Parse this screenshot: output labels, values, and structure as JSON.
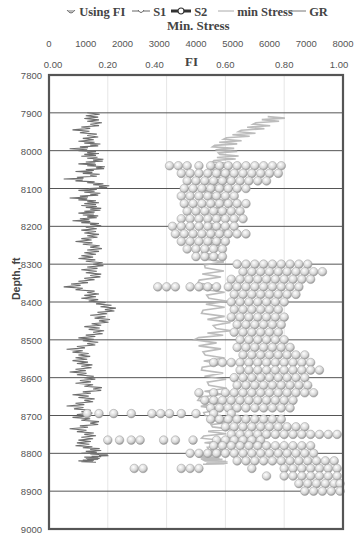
{
  "legend": [
    {
      "label": "Using FI",
      "marker": "bubble-sphere"
    },
    {
      "label": "S1",
      "marker": "thin-line-small-circle"
    },
    {
      "label": "S2",
      "marker": "thick-line-circle"
    },
    {
      "label": "min Stress",
      "marker": "light-line"
    },
    {
      "label": "GR",
      "marker": "dark-line"
    }
  ],
  "top_axis": {
    "title": "Min. Stress",
    "ticks": [
      "0",
      "1000",
      "2000",
      "3000",
      "4000",
      "5000",
      "6000",
      "7000",
      "8000"
    ]
  },
  "fi_axis": {
    "title": "FI",
    "ticks": [
      "0.00",
      "0.20",
      "0.40",
      "0.60",
      "0.80",
      "1.00"
    ]
  },
  "y_axis": {
    "title": "Depth, ft",
    "ticks": [
      "7800",
      "7900",
      "8000",
      "8100",
      "8200",
      "8300",
      "8400",
      "8500",
      "8600",
      "8700",
      "8800",
      "8900",
      "9000"
    ]
  },
  "colors": {
    "gr": "#6e6e6e",
    "min_stress": "#b5b5b5",
    "bubble": "#d9d9d9",
    "bubble_edge": "#8c8c8c",
    "grid": "#555555",
    "frame": "#555555"
  },
  "chart_data": {
    "type": "scatter",
    "title": "",
    "xlabel_top": "Min. Stress",
    "xlabel": "FI",
    "ylabel": "Depth, ft",
    "x_min_stress_range": [
      0,
      8000
    ],
    "x_fi_range": [
      0.0,
      1.0
    ],
    "ylim": [
      7800,
      9000
    ],
    "y_inverted": true,
    "grid": {
      "horizontal": true,
      "vertical": true
    },
    "legend_position": "top",
    "series": [
      {
        "name": "GR",
        "kind": "line",
        "x_fi_equiv": [
          0.15,
          0.14,
          0.16,
          0.1,
          0.15,
          0.12,
          0.16,
          0.09,
          0.15,
          0.13,
          0.17,
          0.12,
          0.18,
          0.11,
          0.16,
          0.07,
          0.15,
          0.19,
          0.12,
          0.16,
          0.09,
          0.15,
          0.13,
          0.16,
          0.12,
          0.15,
          0.1,
          0.16,
          0.13,
          0.15,
          0.11,
          0.16,
          0.14,
          0.12,
          0.17,
          0.13,
          0.16,
          0.12,
          0.07,
          0.15,
          0.13,
          0.18,
          0.21,
          0.16,
          0.19,
          0.14,
          0.17,
          0.12,
          0.15,
          0.08,
          0.12,
          0.1,
          0.13,
          0.09,
          0.14,
          0.11,
          0.17,
          0.1,
          0.14,
          0.08,
          0.13,
          0.1,
          0.16,
          0.09,
          0.14,
          0.12,
          0.11,
          0.16,
          0.13,
          0.19,
          0.14,
          0.15,
          0.12,
          0.14
        ],
        "depth": [
          7900,
          7915,
          7930,
          7945,
          7960,
          7975,
          7985,
          7995,
          8005,
          8015,
          8025,
          8035,
          8045,
          8055,
          8065,
          8075,
          8085,
          8095,
          8105,
          8115,
          8125,
          8135,
          8145,
          8155,
          8165,
          8175,
          8185,
          8195,
          8210,
          8225,
          8240,
          8255,
          8270,
          8285,
          8300,
          8315,
          8330,
          8345,
          8360,
          8375,
          8390,
          8405,
          8420,
          8435,
          8450,
          8465,
          8480,
          8495,
          8510,
          8525,
          8540,
          8555,
          8570,
          8585,
          8600,
          8615,
          8630,
          8645,
          8660,
          8675,
          8690,
          8705,
          8720,
          8735,
          8750,
          8765,
          8780,
          8790,
          8800,
          8805,
          8810,
          8815,
          8820,
          8825
        ]
      },
      {
        "name": "min Stress",
        "kind": "line",
        "x": [
          6200,
          5800,
          5400,
          5000,
          4700,
          4900,
          4700,
          4600,
          4800,
          4600,
          4500,
          4700,
          4500,
          4600,
          4400,
          4500,
          4300,
          4600,
          4400,
          4800,
          4200,
          4500,
          4400,
          4600,
          4300,
          4500,
          4700,
          4400,
          4600,
          4500,
          4300,
          4500,
          4600,
          4400
        ],
        "depth": [
          7910,
          7930,
          7950,
          7970,
          7990,
          8010,
          8030,
          8050,
          8070,
          8090,
          8110,
          8150,
          8190,
          8230,
          8270,
          8310,
          8350,
          8390,
          8430,
          8470,
          8500,
          8540,
          8580,
          8620,
          8660,
          8700,
          8730,
          8760,
          8790,
          8800,
          8810,
          8820,
          8825,
          8830
        ]
      },
      {
        "name": "Using FI",
        "kind": "scatter",
        "points": [
          {
            "depth": 8040,
            "fi": [
              0.41,
              0.44,
              0.47,
              0.51,
              0.55,
              0.58,
              0.61,
              0.64,
              0.67,
              0.7,
              0.73,
              0.76,
              0.79
            ]
          },
          {
            "depth": 8060,
            "fi": [
              0.45,
              0.48,
              0.51,
              0.54,
              0.57,
              0.6,
              0.63,
              0.66,
              0.69,
              0.72,
              0.75,
              0.78
            ]
          },
          {
            "depth": 8080,
            "fi": [
              0.47,
              0.5,
              0.53,
              0.56,
              0.59,
              0.62,
              0.65,
              0.68,
              0.71,
              0.74
            ]
          },
          {
            "depth": 8100,
            "fi": [
              0.46,
              0.49,
              0.52,
              0.55,
              0.58,
              0.61,
              0.64,
              0.67
            ]
          },
          {
            "depth": 8120,
            "fi": [
              0.45,
              0.48,
              0.51,
              0.54,
              0.57,
              0.6,
              0.63
            ]
          },
          {
            "depth": 8140,
            "fi": [
              0.46,
              0.49,
              0.52,
              0.55,
              0.58,
              0.61,
              0.64,
              0.67
            ]
          },
          {
            "depth": 8160,
            "fi": [
              0.47,
              0.5,
              0.53,
              0.56,
              0.59,
              0.62,
              0.65
            ]
          },
          {
            "depth": 8180,
            "fi": [
              0.45,
              0.48,
              0.51,
              0.54,
              0.57,
              0.6,
              0.63,
              0.66
            ]
          },
          {
            "depth": 8200,
            "fi": [
              0.42,
              0.45,
              0.48,
              0.51,
              0.54,
              0.57,
              0.6,
              0.63
            ]
          },
          {
            "depth": 8220,
            "fi": [
              0.43,
              0.46,
              0.49,
              0.52,
              0.55,
              0.58,
              0.61,
              0.64,
              0.67
            ]
          },
          {
            "depth": 8240,
            "fi": [
              0.45,
              0.48,
              0.51,
              0.54,
              0.57,
              0.6
            ]
          },
          {
            "depth": 8260,
            "fi": [
              0.47,
              0.5,
              0.53,
              0.56,
              0.59
            ]
          },
          {
            "depth": 8280,
            "fi": [
              0.5,
              0.53,
              0.56,
              0.59
            ]
          },
          {
            "depth": 8300,
            "fi": [
              0.64,
              0.67,
              0.7,
              0.73,
              0.76,
              0.79,
              0.82,
              0.85,
              0.88
            ]
          },
          {
            "depth": 8320,
            "fi": [
              0.66,
              0.69,
              0.72,
              0.75,
              0.78,
              0.81,
              0.84,
              0.87,
              0.9,
              0.93
            ]
          },
          {
            "depth": 8340,
            "fi": [
              0.62,
              0.65,
              0.68,
              0.71,
              0.74,
              0.77,
              0.8,
              0.83,
              0.86,
              0.89
            ]
          },
          {
            "depth": 8360,
            "fi": [
              0.37,
              0.4,
              0.43,
              0.48,
              0.51,
              0.54,
              0.57,
              0.61,
              0.64,
              0.67,
              0.7,
              0.73,
              0.76,
              0.79,
              0.82,
              0.85
            ]
          },
          {
            "depth": 8380,
            "fi": [
              0.63,
              0.66,
              0.69,
              0.72,
              0.75,
              0.78,
              0.81,
              0.84
            ]
          },
          {
            "depth": 8400,
            "fi": [
              0.62,
              0.65,
              0.68,
              0.71,
              0.74,
              0.77,
              0.8
            ]
          },
          {
            "depth": 8420,
            "fi": [
              0.63,
              0.66,
              0.69,
              0.72,
              0.75,
              0.78
            ]
          },
          {
            "depth": 8440,
            "fi": [
              0.62,
              0.65,
              0.68,
              0.71,
              0.74,
              0.77,
              0.8
            ]
          },
          {
            "depth": 8460,
            "fi": [
              0.64,
              0.67,
              0.7,
              0.73,
              0.76,
              0.79
            ]
          },
          {
            "depth": 8480,
            "fi": [
              0.63,
              0.66,
              0.69,
              0.72,
              0.75,
              0.78
            ]
          },
          {
            "depth": 8500,
            "fi": [
              0.65,
              0.68,
              0.71,
              0.74,
              0.77,
              0.8
            ]
          },
          {
            "depth": 8520,
            "fi": [
              0.64,
              0.67,
              0.7,
              0.73,
              0.76,
              0.79,
              0.82
            ]
          },
          {
            "depth": 8540,
            "fi": [
              0.66,
              0.69,
              0.72,
              0.75,
              0.78,
              0.81,
              0.84,
              0.87
            ]
          },
          {
            "depth": 8560,
            "fi": [
              0.56,
              0.59,
              0.62,
              0.65,
              0.68,
              0.71,
              0.74,
              0.77,
              0.8,
              0.83,
              0.86,
              0.89
            ]
          },
          {
            "depth": 8580,
            "fi": [
              0.65,
              0.68,
              0.71,
              0.74,
              0.77,
              0.8,
              0.83,
              0.86,
              0.89,
              0.92
            ]
          },
          {
            "depth": 8600,
            "fi": [
              0.63,
              0.66,
              0.69,
              0.72,
              0.75,
              0.78,
              0.81,
              0.84,
              0.87
            ]
          },
          {
            "depth": 8620,
            "fi": [
              0.64,
              0.67,
              0.7,
              0.73,
              0.76,
              0.79,
              0.82,
              0.85,
              0.88
            ]
          },
          {
            "depth": 8640,
            "fi": [
              0.51,
              0.56,
              0.6,
              0.63,
              0.66,
              0.69,
              0.72,
              0.75,
              0.78,
              0.81,
              0.84,
              0.87,
              0.9
            ]
          },
          {
            "depth": 8660,
            "fi": [
              0.53,
              0.56,
              0.59,
              0.62,
              0.65,
              0.68,
              0.71,
              0.74,
              0.77,
              0.8,
              0.83
            ]
          },
          {
            "depth": 8680,
            "fi": [
              0.55,
              0.58,
              0.61,
              0.64,
              0.67,
              0.7,
              0.73,
              0.76,
              0.79,
              0.82
            ]
          },
          {
            "depth": 8695,
            "fi": [
              0.13,
              0.17,
              0.22,
              0.28,
              0.35,
              0.38,
              0.41,
              0.45,
              0.5,
              0.56,
              0.62
            ]
          },
          {
            "depth": 8710,
            "fi": [
              0.55,
              0.58,
              0.61,
              0.64,
              0.67,
              0.7,
              0.73,
              0.76,
              0.79
            ]
          },
          {
            "depth": 8730,
            "fi": [
              0.6,
              0.63,
              0.66,
              0.69,
              0.72,
              0.75,
              0.78,
              0.81,
              0.84,
              0.87
            ]
          },
          {
            "depth": 8750,
            "fi": [
              0.62,
              0.65,
              0.68,
              0.71,
              0.74,
              0.77,
              0.8,
              0.83,
              0.86,
              0.89,
              0.92,
              0.95,
              0.98
            ]
          },
          {
            "depth": 8765,
            "fi": [
              0.2,
              0.24,
              0.28,
              0.31,
              0.39,
              0.43,
              0.49,
              0.57,
              0.6,
              0.63,
              0.66,
              0.69,
              0.72
            ]
          },
          {
            "depth": 8780,
            "fi": [
              0.56,
              0.59,
              0.62,
              0.65,
              0.68,
              0.71,
              0.74,
              0.77,
              0.8,
              0.83,
              0.86,
              0.89
            ]
          },
          {
            "depth": 8800,
            "fi": [
              0.48,
              0.51,
              0.54,
              0.57,
              0.6,
              0.63,
              0.66,
              0.69,
              0.72,
              0.75,
              0.78,
              0.81,
              0.84,
              0.87,
              0.9
            ]
          },
          {
            "depth": 8820,
            "fi": [
              0.64,
              0.67,
              0.7,
              0.73,
              0.76,
              0.79,
              0.82,
              0.85,
              0.88,
              0.91,
              0.94,
              0.97
            ]
          },
          {
            "depth": 8840,
            "fi": [
              0.29,
              0.32,
              0.45,
              0.48,
              0.51,
              0.69,
              0.8,
              0.83,
              0.86,
              0.89,
              0.92,
              0.95,
              0.98
            ]
          },
          {
            "depth": 8860,
            "fi": [
              0.74,
              0.8,
              0.83,
              0.86,
              0.89,
              0.92,
              0.95,
              0.98
            ]
          },
          {
            "depth": 8880,
            "fi": [
              0.85,
              0.88,
              0.91,
              0.94,
              0.97,
              0.99
            ]
          },
          {
            "depth": 8900,
            "fi": [
              0.87,
              0.9,
              0.93,
              0.96,
              0.99
            ]
          }
        ]
      },
      {
        "name": "S1",
        "kind": "line-marker",
        "points": []
      },
      {
        "name": "S2",
        "kind": "line-marker",
        "points": []
      }
    ]
  }
}
